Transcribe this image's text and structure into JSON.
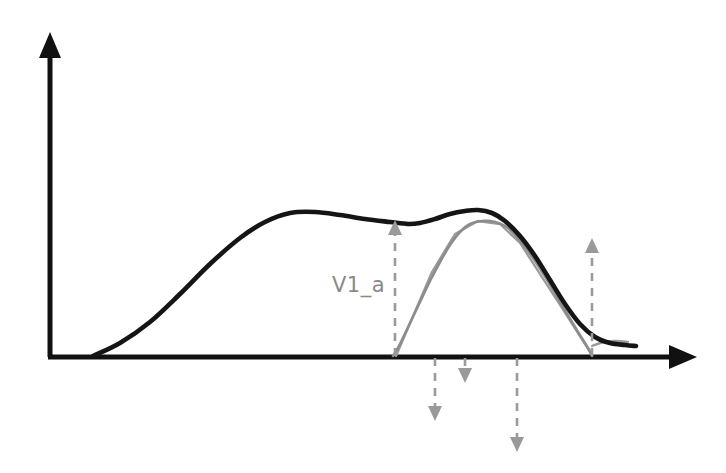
{
  "figure": {
    "background_color": "#ffffff",
    "width": 726,
    "height": 473,
    "kind": "hand-drawn schematic line plot"
  },
  "axes": {
    "y_axis": {
      "name": "vertical-axis",
      "color": "#111111",
      "origin_x": 50,
      "top_y": 32,
      "bottom_y": 357,
      "arrowhead": "up"
    },
    "x_axis": {
      "name": "horizontal-axis",
      "color": "#111111",
      "baseline_y": 357,
      "left_x": 50,
      "right_x": 697,
      "arrowhead": "right"
    },
    "tick_labels": [],
    "axis_titles": {
      "x": "",
      "y": ""
    }
  },
  "annotations": {
    "label_v1a": {
      "text": "V1_a",
      "color": "#8a8a8a",
      "x": 332,
      "y": 292
    }
  },
  "markers": {
    "color": "#9a9a9a",
    "style": "dashed",
    "items": [
      {
        "name": "v1a-boundary-marker",
        "direction": "up",
        "x": 395,
        "from_y": 356,
        "to_y": 220,
        "label": "V1_a"
      },
      {
        "name": "right-boundary-marker",
        "direction": "up",
        "x": 592,
        "from_y": 356,
        "to_y": 238,
        "label": ""
      },
      {
        "name": "down-marker-1",
        "direction": "down",
        "x": 435,
        "from_y": 358,
        "to_y": 421,
        "label": ""
      },
      {
        "name": "down-marker-2",
        "direction": "down",
        "x": 465,
        "from_y": 358,
        "to_y": 383,
        "label": ""
      },
      {
        "name": "down-marker-3",
        "direction": "down",
        "x": 517,
        "from_y": 358,
        "to_y": 452,
        "label": ""
      }
    ]
  },
  "chart_data": {
    "type": "line",
    "title": "",
    "subtitle": "",
    "xlabel": "",
    "ylabel": "",
    "xlim": [
      50,
      697
    ],
    "ylim": [
      357,
      32
    ],
    "grid": false,
    "legend": false,
    "legend_position": "none",
    "annotations": [
      "V1_a"
    ],
    "series": [
      {
        "name": "total-distribution",
        "color": "#151515",
        "style": "solid",
        "width": 4.6,
        "description": "Bimodal envelope: broad first mode, shallow saddle at V1_a, narrower second mode, long right tail",
        "points": [
          [
            93,
            356
          ],
          [
            120,
            343
          ],
          [
            150,
            322
          ],
          [
            180,
            294
          ],
          [
            210,
            264
          ],
          [
            240,
            238
          ],
          [
            265,
            222
          ],
          [
            290,
            213
          ],
          [
            315,
            212
          ],
          [
            340,
            215
          ],
          [
            365,
            219
          ],
          [
            390,
            222
          ],
          [
            408,
            224
          ],
          [
            420,
            223
          ],
          [
            435,
            219
          ],
          [
            450,
            214
          ],
          [
            465,
            211
          ],
          [
            478,
            210
          ],
          [
            492,
            213
          ],
          [
            505,
            221
          ],
          [
            520,
            236
          ],
          [
            535,
            256
          ],
          [
            550,
            280
          ],
          [
            565,
            304
          ],
          [
            580,
            324
          ],
          [
            595,
            337
          ],
          [
            610,
            343
          ],
          [
            625,
            345
          ],
          [
            636,
            346
          ]
        ]
      },
      {
        "name": "component-distribution",
        "color": "#8c8c8c",
        "style": "solid",
        "width": 2.6,
        "description": "Narrow second component rising steeply from the V1_a boundary, peaking just under the total, then falling to baseline",
        "points": [
          [
            393,
            356
          ],
          [
            400,
            344
          ],
          [
            410,
            323
          ],
          [
            420,
            302
          ],
          [
            430,
            281
          ],
          [
            440,
            262
          ],
          [
            450,
            245
          ],
          [
            460,
            232
          ],
          [
            470,
            224
          ],
          [
            482,
            221
          ],
          [
            495,
            222
          ],
          [
            508,
            228
          ],
          [
            522,
            243
          ],
          [
            537,
            264
          ],
          [
            552,
            288
          ],
          [
            566,
            312
          ],
          [
            578,
            332
          ],
          [
            588,
            348
          ],
          [
            592,
            356
          ]
        ]
      },
      {
        "name": "component-distribution-linear",
        "color": "#9a9a9a",
        "style": "solid",
        "width": 2.3,
        "description": "Piecewise-linear sketch overlapping the narrow component: straight rising flank and straight falling flank",
        "points": [
          [
            396,
            356
          ],
          [
            432,
            272
          ],
          [
            455,
            234
          ],
          [
            478,
            221
          ],
          [
            500,
            224
          ],
          [
            520,
            243
          ],
          [
            560,
            305
          ],
          [
            590,
            352
          ]
        ]
      },
      {
        "name": "component-tail",
        "color": "#9a9a9a",
        "style": "solid",
        "width": 2.3,
        "description": "Short faint tail continuing past the right boundary below the total curve",
        "points": [
          [
            592,
            346
          ],
          [
            604,
            342
          ],
          [
            616,
            341
          ],
          [
            628,
            342
          ]
        ]
      }
    ]
  }
}
